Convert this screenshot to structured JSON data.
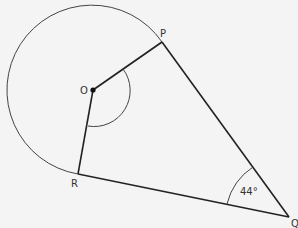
{
  "diagram": {
    "points": {
      "O": {
        "label": "O"
      },
      "P": {
        "label": "P"
      },
      "Q": {
        "label": "Q"
      },
      "R": {
        "label": "R"
      }
    },
    "angle_Q_label": "44°"
  }
}
